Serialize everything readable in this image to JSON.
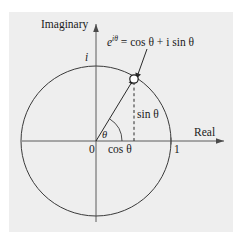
{
  "figure": {
    "kind": "unit-circle-complex-plane",
    "background_color": "#ffffff",
    "panel_color": "#eeeeee",
    "stroke_color": "#3a3a3a",
    "axes": {
      "imaginary_label": "Imaginary",
      "real_label": "Real",
      "origin_label": "0",
      "unit_real_label": "1",
      "unit_imaginary_label": "i"
    },
    "annotations": {
      "formula_base": "e",
      "formula_exponent": "iθ",
      "formula_rhs": " = cos θ + i sin θ",
      "formula_full": "e^{iθ} = cos θ + i sin θ",
      "angle_label": "θ",
      "adjacent_label": "cos θ",
      "opposite_label": "sin θ"
    },
    "geometry": {
      "center_x": 96,
      "center_y": 141,
      "radius": 75,
      "point_x": 134,
      "point_y": 79,
      "point_marker": "open-circle",
      "angle_degrees": 58
    }
  }
}
